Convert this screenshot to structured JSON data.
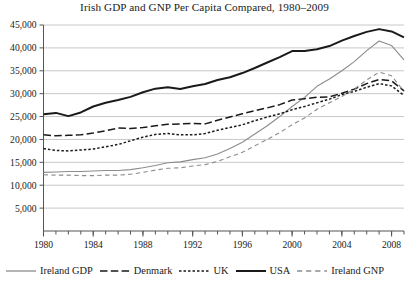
{
  "chart_data": {
    "type": "line",
    "title": "Irish GDP and GNP Per Capita Compared, 1980–2009",
    "xlabel": "",
    "ylabel": "",
    "xlim": [
      1980,
      2009
    ],
    "ylim": [
      0,
      45000
    ],
    "grid": true,
    "grid_axis": "y",
    "legend_position": "below",
    "y_ticks": [
      5000,
      10000,
      15000,
      20000,
      25000,
      30000,
      35000,
      40000,
      45000
    ],
    "y_tick_labels": [
      "5,000",
      "10,000",
      "15,000",
      "20,000",
      "25,000",
      "30,000",
      "35,000",
      "40,000",
      "45,000"
    ],
    "x_ticks": [
      1980,
      1984,
      1988,
      1992,
      1996,
      2000,
      2004,
      2008
    ],
    "x_tick_labels": [
      "1980",
      "1984",
      "1988",
      "1992",
      "1996",
      "2000",
      "2004",
      "2008"
    ],
    "x_minor_tick_interval": 1,
    "x": [
      1980,
      1981,
      1982,
      1983,
      1984,
      1985,
      1986,
      1987,
      1988,
      1989,
      1990,
      1991,
      1992,
      1993,
      1994,
      1995,
      1996,
      1997,
      1998,
      1999,
      2000,
      2001,
      2002,
      2003,
      2004,
      2005,
      2006,
      2007,
      2008,
      2009
    ],
    "series": [
      {
        "name": "Ireland GDP",
        "color": "#8c8c8c",
        "style": "solid",
        "width": 1.1,
        "values": [
          12800,
          12900,
          13000,
          13000,
          13100,
          13200,
          13200,
          13400,
          13800,
          14300,
          14900,
          15100,
          15600,
          16000,
          16800,
          18000,
          19400,
          21200,
          23000,
          25000,
          27200,
          29200,
          31600,
          33200,
          35000,
          37000,
          39400,
          41500,
          40500,
          37400
        ]
      },
      {
        "name": "Denmark",
        "color": "#1a1a1a",
        "style": "longdash",
        "width": 1.5,
        "values": [
          21000,
          20800,
          20900,
          21000,
          21400,
          21900,
          22500,
          22400,
          22600,
          23000,
          23300,
          23400,
          23500,
          23400,
          24200,
          24900,
          25600,
          26300,
          26900,
          27600,
          28600,
          28900,
          29200,
          29300,
          30100,
          31000,
          32200,
          33100,
          32800,
          30600
        ]
      },
      {
        "name": "UK",
        "color": "#1a1a1a",
        "style": "dot",
        "width": 1.5,
        "values": [
          18000,
          17600,
          17500,
          17700,
          17900,
          18400,
          18900,
          19700,
          20500,
          21100,
          21300,
          21000,
          21000,
          21300,
          22000,
          22600,
          23200,
          24100,
          24900,
          25600,
          26500,
          27200,
          28000,
          28800,
          29800,
          30500,
          31400,
          32200,
          31700,
          29600
        ]
      },
      {
        "name": "USA",
        "color": "#1a1a1a",
        "style": "solid",
        "width": 2.0,
        "values": [
          25500,
          25800,
          25100,
          25900,
          27200,
          28000,
          28600,
          29300,
          30300,
          31100,
          31400,
          31000,
          31600,
          32100,
          33000,
          33600,
          34500,
          35600,
          36800,
          38000,
          39300,
          39300,
          39700,
          40400,
          41600,
          42600,
          43500,
          44100,
          43600,
          42300
        ]
      },
      {
        "name": "Ireland GNP",
        "color": "#8c8c8c",
        "style": "dash",
        "width": 1.1,
        "values": [
          12300,
          12200,
          12200,
          12100,
          12100,
          12200,
          12200,
          12400,
          12800,
          13300,
          13700,
          13800,
          14200,
          14500,
          15200,
          16200,
          17200,
          18600,
          20000,
          21500,
          23200,
          24700,
          26600,
          28000,
          29400,
          31000,
          33000,
          34700,
          33900,
          30500
        ]
      }
    ]
  },
  "legend": {
    "entries": [
      {
        "label": "Ireland GDP"
      },
      {
        "label": "Denmark"
      },
      {
        "label": "UK"
      },
      {
        "label": "USA"
      },
      {
        "label": "Ireland GNP"
      }
    ]
  },
  "colors": {
    "axis": "#555555",
    "grid": "#c8c8c8",
    "text": "#1a1a1a",
    "ireland": "#8c8c8c",
    "dark": "#1a1a1a"
  }
}
